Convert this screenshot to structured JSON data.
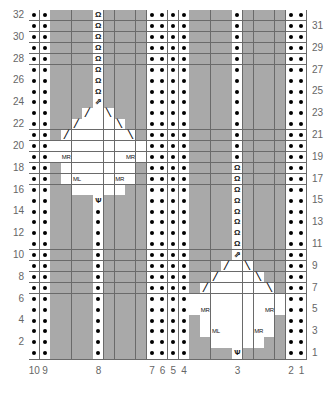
{
  "chart": {
    "type": "knitting-chart",
    "columns": 26,
    "rows": 32,
    "colors": {
      "no_stitch": "#a9a9a9",
      "stitch": "#ffffff",
      "grid": "#6a6a6a",
      "label": "#666666"
    },
    "legend_codes": {
      "P": "purl (dot)",
      "G": "no stitch (grey)",
      "K": "knit (blank white)",
      "Q": "knit through back loop (twisted)",
      "U": "centered decrease",
      "V": "increase into stitch",
      "L": "left-leaning slash",
      "R": "right-leaning slash",
      "A": "MR",
      "B": "ML"
    },
    "symbol_glyphs": {
      "Q": "Ω",
      "U": "⇗",
      "V": "Ѱ",
      "L": "╱",
      "R": "╲",
      "A": "MR",
      "B": "ML"
    },
    "grid_rows_top_to_bottom": [
      {
        "row": 32,
        "cells": "PPGGGGQGGGGPPPPGGGGPGGGGPP"
      },
      {
        "row": 31,
        "cells": "PPGGGGQGGGGPPPPGGGGPGGGGPP"
      },
      {
        "row": 30,
        "cells": "PPGGGGQGGGGPPPPGGGGPGGGGPP"
      },
      {
        "row": 29,
        "cells": "PPGGGGQGGGGPPPPGGGGPGGGGPP"
      },
      {
        "row": 28,
        "cells": "PPGGGGQGGGGPPPPGGGGPGGGGPP"
      },
      {
        "row": 27,
        "cells": "PPGGGGQGGGGPPPPGGGGPGGGGPP"
      },
      {
        "row": 26,
        "cells": "PPGGGGQGGGGPPPPGGGGPGGGGPP"
      },
      {
        "row": 25,
        "cells": "PPGGGGQGGGGPPPPGGGGPGGGGPP"
      },
      {
        "row": 24,
        "cells": "PPGGGGUGGGGPPPPGGGGPGGGGPP"
      },
      {
        "row": 23,
        "cells": "PPGGGLKRGGGPPPPGGGGPGGGGPP"
      },
      {
        "row": 22,
        "cells": "PPGGLKKKRGGPPPPGGGGPGGGGPP"
      },
      {
        "row": 21,
        "cells": "PPGLKKKKKRGPPPPGGGGPGGGGPP"
      },
      {
        "row": 20,
        "cells": "PPKKKKKKKKKPPPPGGGGPGGGGPP"
      },
      {
        "row": 19,
        "cells": "PPKAKKKKKAKPPPPGGGGPGGGGPP"
      },
      {
        "row": 18,
        "cells": "PPGKKKKKKKGPPPPGGGGQGGGGPP"
      },
      {
        "row": 17,
        "cells": "PPGKBKKKAKGPPPPGGGGQGGGGPP"
      },
      {
        "row": 16,
        "cells": "PPGGKKKKKGGPPPPGGGGQGGGGPP"
      },
      {
        "row": 15,
        "cells": "PPGGGGVGGGGPPPPGGGGQGGGGPP"
      },
      {
        "row": 14,
        "cells": "PPGGGGPGGGGPPPPGGGGQGGGGPP"
      },
      {
        "row": 13,
        "cells": "PPGGGGPGGGGPPPPGGGGQGGGGPP"
      },
      {
        "row": 12,
        "cells": "PPGGGGPGGGGPPPPGGGGQGGGGPP"
      },
      {
        "row": 11,
        "cells": "PPGGGGPGGGGPPPPGGGGQGGGGPP"
      },
      {
        "row": 10,
        "cells": "PPGGGGPGGGGPPPPGGGGUGGGGPP"
      },
      {
        "row": 9,
        "cells": "PPGGGGPGGGGPPPPGGGLKRGGGPP"
      },
      {
        "row": 8,
        "cells": "PPGGGGPGGGGPPPPGGLKKKRGGPP"
      },
      {
        "row": 7,
        "cells": "PPGGGGPGGGGPPPPGLKKKKKRGPP"
      },
      {
        "row": 6,
        "cells": "PPGGGGPGGGGPPPPKKKKKKKKKPP"
      },
      {
        "row": 5,
        "cells": "PPGGGGPGGGGPPPPKAKKKKKAKPP"
      },
      {
        "row": 4,
        "cells": "PPGGGGPGGGGPPPPGKKKKKKKGPP"
      },
      {
        "row": 3,
        "cells": "PPGGGGPGGGGPPPPGKBKKKAKGPP"
      },
      {
        "row": 2,
        "cells": "PPGGGGPGGGGPPPPGGKKKKKGGPP"
      },
      {
        "row": 1,
        "cells": "PPGGGGPGGGGPPPPGGGGVGGGGPP"
      }
    ],
    "left_row_labels": [
      "32",
      "30",
      "28",
      "26",
      "24",
      "22",
      "20",
      "18",
      "16",
      "14",
      "12",
      "10",
      "8",
      "6",
      "4",
      "2"
    ],
    "right_row_labels": [
      "31",
      "29",
      "27",
      "25",
      "23",
      "21",
      "19",
      "17",
      "15",
      "13",
      "11",
      "9",
      "7",
      "5",
      "3",
      "1"
    ],
    "column_labels": [
      {
        "label": "10",
        "col_index": 0
      },
      {
        "label": "9",
        "col_index": 1
      },
      {
        "label": "8",
        "col_index": 6
      },
      {
        "label": "7",
        "col_index": 11
      },
      {
        "label": "6",
        "col_index": 12
      },
      {
        "label": "5",
        "col_index": 13
      },
      {
        "label": "4",
        "col_index": 14
      },
      {
        "label": "3",
        "col_index": 19
      },
      {
        "label": "2",
        "col_index": 24
      },
      {
        "label": "1",
        "col_index": 25
      }
    ]
  }
}
